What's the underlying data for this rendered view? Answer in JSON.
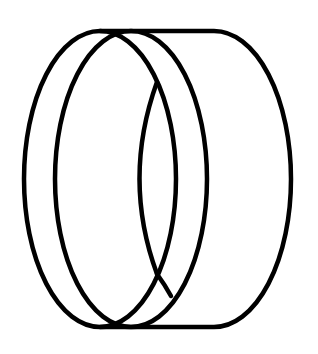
{
  "image": {
    "subject": "ring-band-icon",
    "description": "Black line drawing of a ring / band shown in perspective",
    "stroke_color": "#000000",
    "background_color": "#ffffff"
  }
}
